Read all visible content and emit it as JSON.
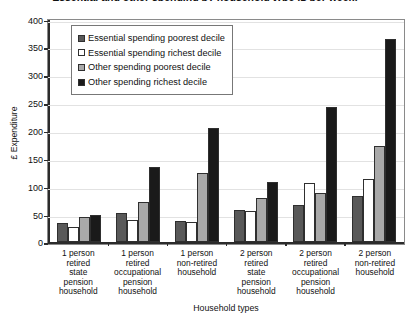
{
  "chart_data": {
    "type": "bar",
    "title": "Essential and other spending by household type (£ per week)",
    "xlabel": "Household types",
    "ylabel": "£ Expenditure",
    "ylim": [
      0,
      400
    ],
    "yticks": [
      0,
      50,
      100,
      150,
      200,
      250,
      300,
      350,
      400
    ],
    "grid": true,
    "legend_position": "top-left-inside",
    "categories": [
      "1 person retired state pension household",
      "1 person retired occupational pension household",
      "1 person non-retired household",
      "2 person retired state pension household",
      "2 person retired occupational pension household",
      "2 person non-retired household"
    ],
    "category_lines": [
      [
        "1 person",
        "retired",
        "state",
        "pension",
        "household"
      ],
      [
        "1 person",
        "retired",
        "occupational",
        "pension",
        "household"
      ],
      [
        "1 person",
        "non-retired",
        "household"
      ],
      [
        "2 person",
        "retired",
        "state",
        "pension",
        "household"
      ],
      [
        "2 person",
        "retired",
        "occupational",
        "pension",
        "household"
      ],
      [
        "2 person",
        "non-retired",
        "household"
      ]
    ],
    "series": [
      {
        "name": "Essential spending poorest decile",
        "color": "#595959",
        "values": [
          35,
          52,
          38,
          59,
          68,
          83
        ]
      },
      {
        "name": "Essential spending richest decile",
        "color": "#ffffff",
        "values": [
          28,
          41,
          36,
          57,
          106,
          113
        ]
      },
      {
        "name": "Other spending poorest decile",
        "color": "#a9a9a9",
        "values": [
          46,
          72,
          125,
          79,
          88,
          173
        ]
      },
      {
        "name": "Other spending richest decile",
        "color": "#1a1a1a",
        "values": [
          49,
          136,
          205,
          109,
          243,
          365
        ]
      }
    ]
  }
}
